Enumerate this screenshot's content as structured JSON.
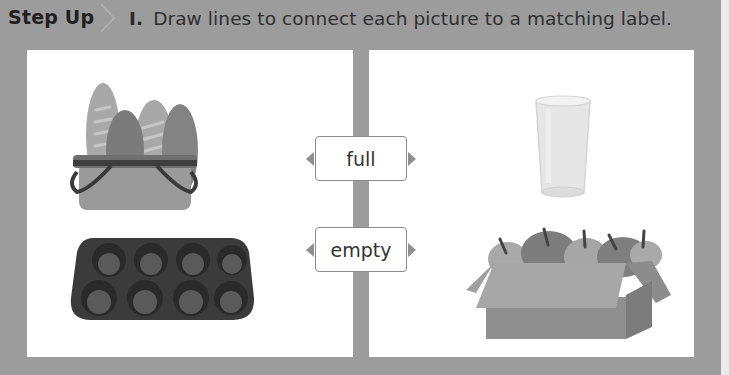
{
  "header": {
    "badge": "Step Up",
    "question_number": "I.",
    "instruction": "Draw lines to connect each picture to a matching label."
  },
  "labels": [
    {
      "id": "full",
      "text": "full"
    },
    {
      "id": "empty",
      "text": "empty"
    }
  ],
  "pictures": {
    "left": [
      {
        "name": "bread-basket",
        "description": "basket full of bread loaves"
      },
      {
        "name": "muffin-tin",
        "description": "empty muffin tin"
      }
    ],
    "right": [
      {
        "name": "empty-glass",
        "description": "empty drinking glass"
      },
      {
        "name": "apple-box",
        "description": "box full of apples"
      }
    ]
  },
  "colors": {
    "page_background": "#9c9c9c",
    "panel_background": "#ffffff",
    "label_border": "#8a8a8a",
    "text": "#333333"
  }
}
